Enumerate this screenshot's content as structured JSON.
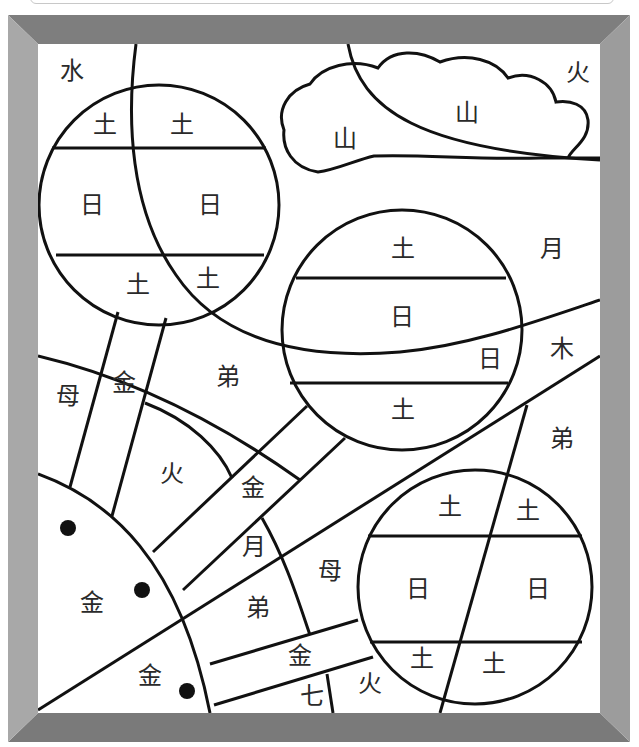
{
  "puzzle": {
    "frame": {
      "outer": [
        8,
        15,
        630,
        742
      ],
      "inner": [
        38,
        44,
        600,
        713
      ],
      "colors": {
        "top": "#808080",
        "bottom": "#7a7a7a",
        "left": "#a6a6a6",
        "right": "#9a9a9a",
        "stroke": "#111111"
      }
    },
    "labels": [
      {
        "id": "water-topleft",
        "text": "水",
        "x": 72,
        "y": 82
      },
      {
        "id": "fire-topright",
        "text": "火",
        "x": 578,
        "y": 82
      },
      {
        "id": "cloud-mountain-left",
        "text": "山",
        "x": 345,
        "y": 148
      },
      {
        "id": "cloud-mountain-right",
        "text": "山",
        "x": 467,
        "y": 122
      },
      {
        "id": "planet1-earth-tl",
        "text": "土",
        "x": 105,
        "y": 133
      },
      {
        "id": "planet1-earth-tr",
        "text": "土",
        "x": 182,
        "y": 133
      },
      {
        "id": "planet1-sun-left",
        "text": "日",
        "x": 92,
        "y": 214
      },
      {
        "id": "planet1-sun-right",
        "text": "日",
        "x": 210,
        "y": 214
      },
      {
        "id": "planet1-earth-bl",
        "text": "土",
        "x": 138,
        "y": 293
      },
      {
        "id": "planet1-earth-br",
        "text": "土",
        "x": 208,
        "y": 288
      },
      {
        "id": "planet2-earth-top",
        "text": "土",
        "x": 403,
        "y": 258
      },
      {
        "id": "planet2-sun-mid",
        "text": "日",
        "x": 402,
        "y": 326
      },
      {
        "id": "planet2-sun-small",
        "text": "日",
        "x": 490,
        "y": 368
      },
      {
        "id": "planet2-earth-bottom",
        "text": "土",
        "x": 403,
        "y": 419
      },
      {
        "id": "moon-right",
        "text": "月",
        "x": 552,
        "y": 258
      },
      {
        "id": "tree-right",
        "text": "木",
        "x": 562,
        "y": 358
      },
      {
        "id": "brother-right",
        "text": "弟",
        "x": 562,
        "y": 448
      },
      {
        "id": "mother-left",
        "text": "母",
        "x": 68,
        "y": 405
      },
      {
        "id": "gold-ray1",
        "text": "金",
        "x": 124,
        "y": 392
      },
      {
        "id": "brother-mid",
        "text": "弟",
        "x": 228,
        "y": 386
      },
      {
        "id": "fire-mid",
        "text": "火",
        "x": 172,
        "y": 483
      },
      {
        "id": "gold-ray2",
        "text": "金",
        "x": 253,
        "y": 497
      },
      {
        "id": "moon-mid",
        "text": "月",
        "x": 254,
        "y": 556
      },
      {
        "id": "mother-mid",
        "text": "母",
        "x": 330,
        "y": 580
      },
      {
        "id": "brother-low",
        "text": "弟",
        "x": 258,
        "y": 617
      },
      {
        "id": "gold-sun",
        "text": "金",
        "x": 92,
        "y": 612
      },
      {
        "id": "gold-ray3",
        "text": "金",
        "x": 300,
        "y": 665
      },
      {
        "id": "gold-sun-low",
        "text": "金",
        "x": 150,
        "y": 685
      },
      {
        "id": "seven-bottom",
        "text": "七",
        "x": 312,
        "y": 705
      },
      {
        "id": "fire-bottom",
        "text": "火",
        "x": 370,
        "y": 693
      },
      {
        "id": "planet3-earth-tl",
        "text": "土",
        "x": 450,
        "y": 516
      },
      {
        "id": "planet3-earth-tr",
        "text": "土",
        "x": 528,
        "y": 520
      },
      {
        "id": "planet3-sun-left",
        "text": "日",
        "x": 418,
        "y": 598
      },
      {
        "id": "planet3-sun-right",
        "text": "日",
        "x": 538,
        "y": 598
      },
      {
        "id": "planet3-earth-bl",
        "text": "土",
        "x": 422,
        "y": 668
      },
      {
        "id": "planet3-earth-br",
        "text": "土",
        "x": 494,
        "y": 673
      }
    ],
    "dots": [
      {
        "x": 68,
        "y": 528
      },
      {
        "x": 142,
        "y": 590
      },
      {
        "x": 187,
        "y": 691
      }
    ]
  }
}
